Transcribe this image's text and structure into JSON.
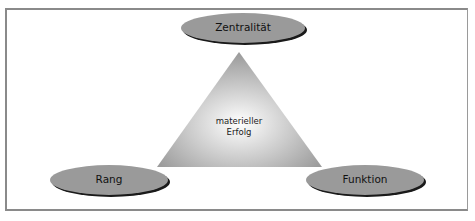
{
  "diagram": {
    "center": {
      "line1": "materieller",
      "line2": "Erfolg"
    },
    "nodes": {
      "top": {
        "label": "Zentralität"
      },
      "left": {
        "label": "Rang"
      },
      "right": {
        "label": "Funktion"
      }
    },
    "colors": {
      "ellipse_fill": "#9a9a9a",
      "ellipse_shadow": "#1a1a1a",
      "triangle_edge": "#a0a0a0",
      "triangle_center": "#ffffff",
      "frame": "#8a8a8a"
    }
  }
}
